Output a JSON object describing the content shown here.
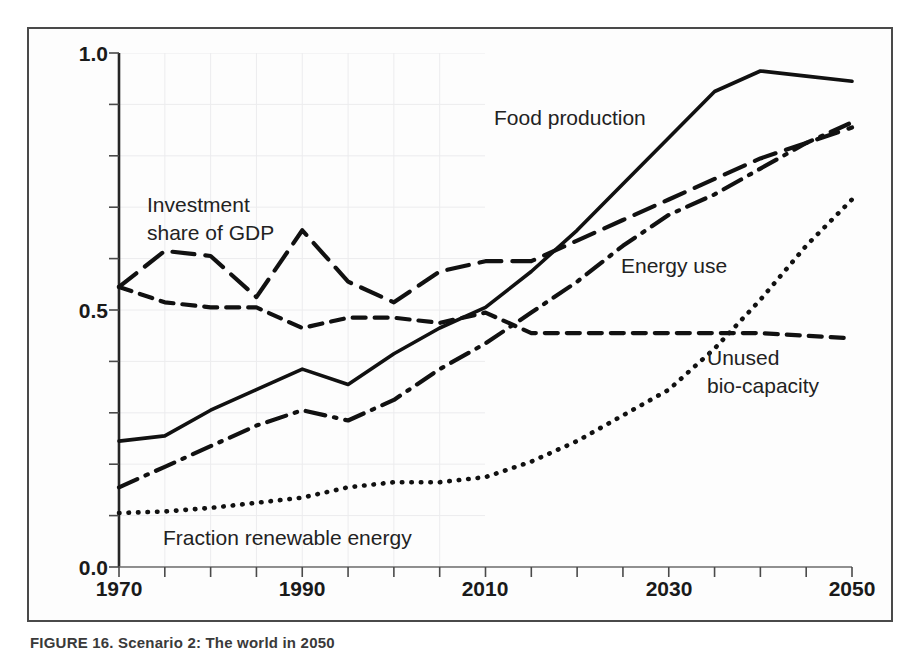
{
  "figure": {
    "caption": "FIGURE 16. Scenario 2: The world in 2050",
    "frame_color": "#4a4a4a",
    "background": "#ffffff"
  },
  "chart_data": {
    "type": "line",
    "title": "",
    "subtitle": "",
    "xlabel": "",
    "ylabel": "",
    "xlim": [
      1970,
      2050
    ],
    "ylim": [
      0.0,
      1.0
    ],
    "grid": "faint-paper-grid-left-region-only",
    "grid_extent_x": [
      1970,
      2010
    ],
    "legend": "inline-labels",
    "x_ticks": [
      1970,
      1975,
      1980,
      1985,
      1990,
      1995,
      2000,
      2005,
      2010,
      2015,
      2020,
      2025,
      2030,
      2035,
      2040,
      2045,
      2050
    ],
    "x_tick_labels": [
      "1970",
      "",
      "",
      "",
      "1990",
      "",
      "",
      "",
      "2010",
      "",
      "",
      "",
      "2030",
      "",
      "",
      "",
      "2050"
    ],
    "x_major_labels": [
      "1970",
      "1990",
      "2010",
      "2030",
      "2050"
    ],
    "y_ticks": [
      0.0,
      0.1,
      0.2,
      0.3,
      0.4,
      0.5,
      0.6,
      0.7,
      0.8,
      0.9,
      1.0
    ],
    "y_tick_labels": [
      "0.0",
      "",
      "",
      "",
      "",
      "0.5",
      "",
      "",
      "",
      "",
      "1.0"
    ],
    "y_major_labels": [
      "0.0",
      "0.5",
      "1.0"
    ],
    "x": [
      1970,
      1975,
      1980,
      1985,
      1990,
      1995,
      2000,
      2005,
      2010,
      2015,
      2020,
      2025,
      2030,
      2035,
      2040,
      2045,
      2050
    ],
    "series": [
      {
        "name": "Food production",
        "style": "solid",
        "label": "Food production",
        "label_x": 2016,
        "label_y": 0.885,
        "values": [
          0.245,
          0.255,
          0.305,
          0.345,
          0.385,
          0.355,
          0.415,
          0.465,
          0.505,
          0.575,
          0.655,
          0.745,
          0.835,
          0.925,
          0.965,
          0.955,
          0.945
        ]
      },
      {
        "name": "Investment share of GDP",
        "style": "long-dash",
        "label": "Investment share of GDP",
        "label_x": 1975,
        "label_y": 0.745,
        "values": [
          0.545,
          0.615,
          0.605,
          0.525,
          0.655,
          0.555,
          0.515,
          0.575,
          0.595,
          0.595,
          0.635,
          0.675,
          0.715,
          0.755,
          0.795,
          0.825,
          0.855
        ]
      },
      {
        "name": "Energy use",
        "style": "dash-dot",
        "label": "Energy use",
        "label_x": 2021,
        "label_y": 0.595,
        "values": [
          0.155,
          0.195,
          0.235,
          0.275,
          0.305,
          0.285,
          0.325,
          0.385,
          0.435,
          0.495,
          0.555,
          0.625,
          0.685,
          0.725,
          0.775,
          0.825,
          0.865
        ]
      },
      {
        "name": "Unused bio-capacity",
        "style": "short-dash",
        "label": "Unused bio-capacity",
        "label_x": 2034,
        "label_y": 0.405,
        "values": [
          0.545,
          0.515,
          0.505,
          0.505,
          0.465,
          0.485,
          0.485,
          0.475,
          0.495,
          0.455,
          0.455,
          0.455,
          0.455,
          0.455,
          0.455,
          0.45,
          0.445
        ]
      },
      {
        "name": "Fraction renewable energy",
        "style": "dotted",
        "label": "Fraction renewable energy",
        "label_x": 1977,
        "label_y": 0.075,
        "values": [
          0.105,
          0.108,
          0.115,
          0.125,
          0.135,
          0.155,
          0.165,
          0.165,
          0.175,
          0.205,
          0.245,
          0.295,
          0.345,
          0.425,
          0.52,
          0.625,
          0.715
        ]
      }
    ]
  },
  "labels": {
    "food_production": "Food production",
    "investment_line1": "Investment",
    "investment_line2": "share of GDP",
    "energy_use": "Energy use",
    "unused_line1": "Unused",
    "unused_line2": "bio-capacity",
    "fraction_renewable": "Fraction renewable energy"
  },
  "axis": {
    "y_top": "1.0",
    "y_mid": "0.5",
    "y_bottom": "0.0",
    "x_1970": "1970",
    "x_1990": "1990",
    "x_2010": "2010",
    "x_2030": "2030",
    "x_2050": "2050"
  }
}
